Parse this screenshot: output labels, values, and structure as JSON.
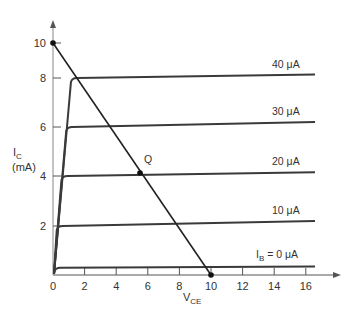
{
  "chart_data": {
    "type": "line",
    "title": "",
    "xlabel": "V_CE",
    "ylabel": "I_C (mA)",
    "xlim": [
      0,
      17
    ],
    "ylim": [
      0,
      10.5
    ],
    "grid": false,
    "x_ticks": [
      "0",
      "2",
      "4",
      "6",
      "8",
      "10",
      "12",
      "14",
      "16"
    ],
    "y_ticks": [
      "2",
      "4",
      "6",
      "8",
      "10"
    ],
    "series": [
      {
        "name": "I_B = 0 μA",
        "label": "= 0 μA",
        "saturation_mA": 0.3,
        "end_mA": 0.35
      },
      {
        "name": "10 μA",
        "label": "10 μA",
        "saturation_mA": 2.0,
        "end_mA": 2.2
      },
      {
        "name": "20 μA",
        "label": "20 μA",
        "saturation_mA": 4.0,
        "end_mA": 4.15
      },
      {
        "name": "30 μA",
        "label": "30 μA",
        "saturation_mA": 6.0,
        "end_mA": 6.2
      },
      {
        "name": "40 μA",
        "label": "40 μA",
        "saturation_mA": 8.0,
        "end_mA": 8.2
      }
    ],
    "load_line": {
      "x": [
        0,
        10
      ],
      "y": [
        10,
        0
      ]
    },
    "annotations": [
      {
        "text": "Q",
        "x": 5.6,
        "y": 4.1
      }
    ]
  },
  "labels": {
    "ylabel_main": "I",
    "ylabel_sub": "C",
    "ylabel_unit": "(mA)",
    "xlabel_main": "V",
    "xlabel_sub": "CE",
    "ib_main": "I",
    "ib_sub": "B",
    "q_label": "Q"
  }
}
